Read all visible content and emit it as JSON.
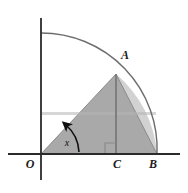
{
  "figure": {
    "type": "geometry-diagram",
    "background_color": "#ffffff",
    "canvas": {
      "width": 188,
      "height": 193
    }
  },
  "labels": {
    "origin": "O",
    "apex": "A",
    "foot": "C",
    "base_end": "B",
    "angle": "x"
  },
  "colors": {
    "triangle_fill": "#a9a9a9",
    "sector_sliver_fill": "#d2d2d2",
    "axis_stroke": "#2b2b2b",
    "arc_stroke": "#6d6d6d",
    "triangle_stroke": "#8c8c8c",
    "altitude_stroke": "#7a7a7a",
    "angle_arrow_stroke": "#111111",
    "right_angle_stroke": "#8a8a8a",
    "label_color": "#1a1a1a"
  },
  "geometry": {
    "origin": {
      "x": 41,
      "y": 154
    },
    "apex": {
      "x": 116,
      "y": 74
    },
    "foot": {
      "x": 116,
      "y": 154
    },
    "base_end": {
      "x": 157,
      "y": 154
    },
    "radius": 116,
    "arc_start_on_y_axis": {
      "x": 41,
      "y": 33
    },
    "x_axis": {
      "x1": 8,
      "y1": 154,
      "x2": 180,
      "y2": 154
    },
    "y_axis": {
      "x1": 41,
      "y1": 18,
      "x2": 41,
      "y2": 180
    },
    "right_angle_marker_size": 11,
    "angle_arc_radius": 36,
    "angle_degrees": 47
  },
  "elements": {
    "x_axis_name": "horizontal-axis",
    "y_axis_name": "vertical-axis",
    "arc_name": "quarter-circle-arc",
    "triangle_name": "triangle-OAB",
    "sliver_name": "circular-segment-sliver",
    "altitude_name": "altitude-AC",
    "angle_name": "angle-marker-x"
  }
}
